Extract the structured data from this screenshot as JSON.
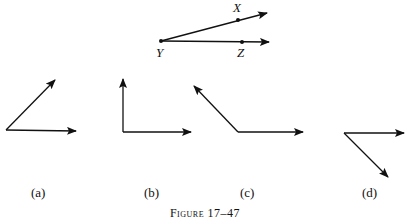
{
  "figure": {
    "caption_prefix": "Figure",
    "caption_number": "17–47",
    "reference_angle": {
      "points": [
        {
          "name": "X",
          "label": "X"
        },
        {
          "name": "Y",
          "label": "Y"
        },
        {
          "name": "Z",
          "label": "Z"
        }
      ]
    },
    "panels": [
      {
        "id": "a",
        "label": "(a)",
        "description": "acute angle"
      },
      {
        "id": "b",
        "label": "(b)",
        "description": "right angle"
      },
      {
        "id": "c",
        "label": "(c)",
        "description": "obtuse angle"
      },
      {
        "id": "d",
        "label": "(d)",
        "description": "acute angle opening downward"
      }
    ]
  }
}
